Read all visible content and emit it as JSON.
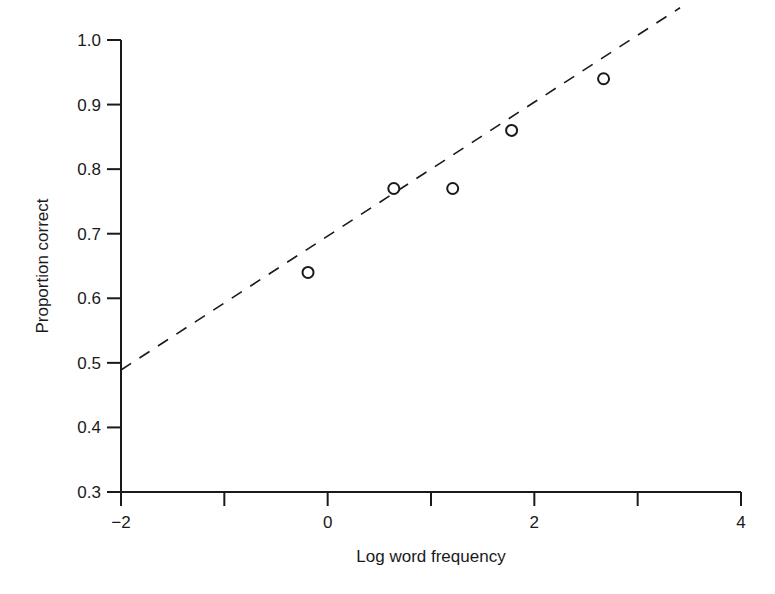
{
  "chart_data": {
    "type": "scatter",
    "title": "",
    "xlabel": "Log word frequency",
    "ylabel": "Proportion correct",
    "xlim": [
      -2,
      4
    ],
    "ylim": [
      0.3,
      1.0
    ],
    "x_ticks": [
      -2,
      -1,
      0,
      1,
      2,
      3,
      4
    ],
    "x_tick_labels": [
      "−2",
      "",
      "0",
      "",
      "2",
      "",
      "4"
    ],
    "y_ticks": [
      0.3,
      0.4,
      0.5,
      0.6,
      0.7,
      0.8,
      0.9,
      1.0
    ],
    "y_tick_labels": [
      "0.3",
      "0.4",
      "0.5",
      "0.6",
      "0.7",
      "0.8",
      "0.9",
      "1.0"
    ],
    "grid": false,
    "legend": null,
    "series": [
      {
        "name": "observed",
        "marker": "open-circle",
        "points": [
          {
            "x": -0.19,
            "y": 0.64
          },
          {
            "x": 0.64,
            "y": 0.77
          },
          {
            "x": 1.21,
            "y": 0.77
          },
          {
            "x": 1.78,
            "y": 0.86
          },
          {
            "x": 2.67,
            "y": 0.94
          }
        ]
      },
      {
        "name": "fitted line",
        "style": "dashed",
        "points": [
          {
            "x": -2.0,
            "y": 0.489
          },
          {
            "x": 3.41,
            "y": 1.05
          }
        ]
      }
    ]
  },
  "layout": {
    "plot_left": 121,
    "plot_right": 741,
    "plot_top": 40,
    "plot_bottom": 492,
    "color": "#1a1a1a"
  }
}
